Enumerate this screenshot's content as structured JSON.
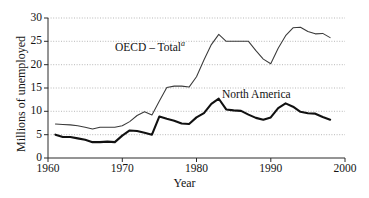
{
  "chart_data": {
    "type": "line",
    "title": "",
    "xlabel": "Year",
    "ylabel": "Millions of unemployed",
    "xlim": [
      1960,
      2000
    ],
    "ylim": [
      0,
      30
    ],
    "xticks": [
      "1960",
      "1970",
      "1980",
      "1990",
      "2000"
    ],
    "yticks": [
      "0",
      "5",
      "10",
      "15",
      "20",
      "25",
      "30"
    ],
    "grid": "horizontal-dotted",
    "legend": "inline-annotations",
    "annotations": [
      {
        "text": "OECD – Total",
        "note": "a",
        "series": "oecd_total"
      },
      {
        "text": "North America",
        "note": "",
        "series": "north_america"
      }
    ],
    "x": [
      1961,
      1962,
      1963,
      1964,
      1965,
      1966,
      1967,
      1968,
      1969,
      1970,
      1971,
      1972,
      1973,
      1974,
      1975,
      1976,
      1977,
      1978,
      1979,
      1980,
      1981,
      1982,
      1983,
      1984,
      1985,
      1986,
      1987,
      1988,
      1989,
      1990,
      1991,
      1992,
      1993,
      1994,
      1995,
      1996,
      1997,
      1998
    ],
    "series": [
      {
        "name": "OECD – Total",
        "values": [
          7.3,
          7.2,
          7.1,
          6.9,
          6.6,
          6.2,
          6.6,
          6.6,
          6.6,
          6.9,
          7.8,
          9.1,
          9.9,
          9.2,
          12.2,
          15.1,
          15.4,
          15.4,
          15.2,
          17.4,
          21.0,
          24.3,
          26.5,
          25.0,
          25.0,
          25.0,
          25.0,
          23.0,
          21.2,
          20.2,
          23.5,
          26.2,
          27.9,
          28.0,
          27.1,
          26.6,
          26.7,
          25.8
        ]
      },
      {
        "name": "North America",
        "values": [
          5.0,
          4.5,
          4.5,
          4.2,
          3.9,
          3.4,
          3.4,
          3.5,
          3.4,
          4.8,
          5.9,
          5.8,
          5.4,
          5.0,
          8.9,
          8.4,
          8.0,
          7.4,
          7.3,
          8.7,
          9.6,
          11.6,
          12.7,
          10.4,
          10.2,
          10.1,
          9.3,
          8.6,
          8.2,
          8.7,
          10.7,
          11.7,
          11.0,
          9.9,
          9.6,
          9.5,
          8.8,
          8.2
        ]
      }
    ]
  },
  "axes": {
    "y_title": "Millions of unemployed",
    "x_title": "Year",
    "y_tick_labels": [
      "30",
      "25",
      "20",
      "15",
      "10",
      "5",
      "0"
    ],
    "x_tick_labels": [
      "1960",
      "1970",
      "1980",
      "1990",
      "2000"
    ]
  },
  "labels": {
    "oecd_text": "OECD – Total",
    "oecd_superscript": "a",
    "north_america_text": "North America"
  }
}
